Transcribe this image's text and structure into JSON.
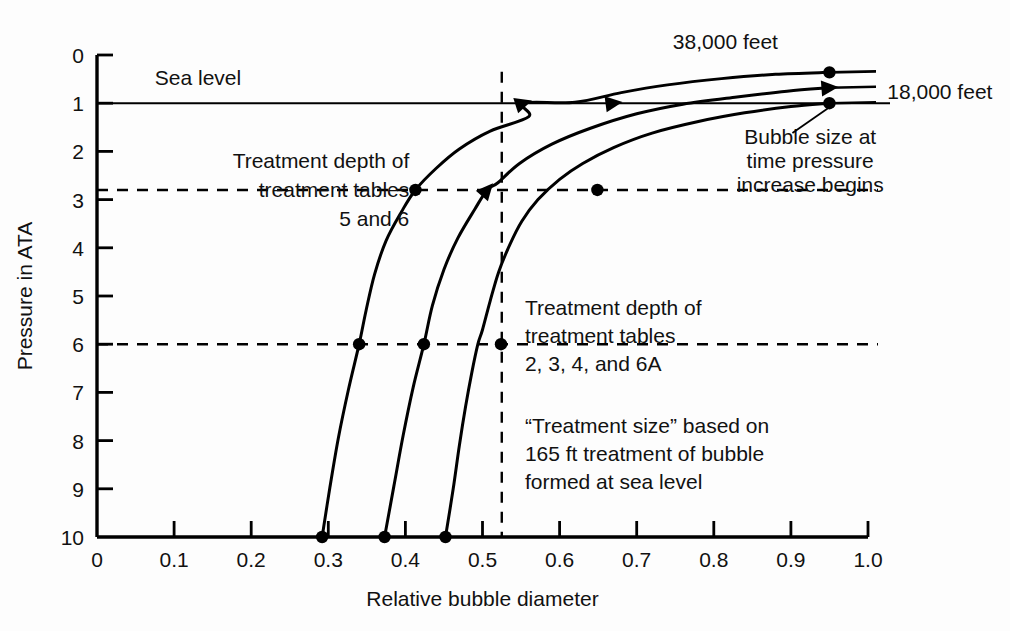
{
  "chart_data": {
    "type": "line",
    "title": "",
    "xlabel": "Relative bubble diameter",
    "ylabel": "Pressure in ATA",
    "xlim": [
      0,
      1.0
    ],
    "ylim": [
      0,
      10
    ],
    "y_axis_inverted": true,
    "grid": false,
    "legend_position": "none",
    "xticks": [
      "0",
      "0.1",
      "0.2",
      "0.3",
      "0.4",
      "0.5",
      "0.6",
      "0.7",
      "0.8",
      "0.9",
      "1.0"
    ],
    "xtick_values": [
      0,
      0.1,
      0.2,
      0.3,
      0.4,
      0.5,
      0.6,
      0.7,
      0.8,
      0.9,
      1.0
    ],
    "yticks": [
      "0",
      "1",
      "2",
      "3",
      "4",
      "5",
      "6",
      "7",
      "8",
      "9",
      "10"
    ],
    "ytick_values": [
      0,
      1,
      2,
      3,
      4,
      5,
      6,
      7,
      8,
      9,
      10
    ],
    "series": [
      {
        "name": "Bubble formed at sea level",
        "start_altitude_label": "sea level",
        "points": [
          {
            "x": 0.95,
            "y": 1.0
          },
          {
            "x": 0.9,
            "y": 1.07
          },
          {
            "x": 0.84,
            "y": 1.2
          },
          {
            "x": 0.78,
            "y": 1.38
          },
          {
            "x": 0.72,
            "y": 1.62
          },
          {
            "x": 0.67,
            "y": 1.92
          },
          {
            "x": 0.63,
            "y": 2.25
          },
          {
            "x": 0.6,
            "y": 2.58
          },
          {
            "x": 0.572,
            "y": 3.0
          },
          {
            "x": 0.551,
            "y": 3.45
          },
          {
            "x": 0.535,
            "y": 3.95
          },
          {
            "x": 0.521,
            "y": 4.5
          },
          {
            "x": 0.51,
            "y": 5.1
          },
          {
            "x": 0.5,
            "y": 5.7
          },
          {
            "x": 0.494,
            "y": 6.0
          },
          {
            "x": 0.486,
            "y": 6.6
          },
          {
            "x": 0.478,
            "y": 7.3
          },
          {
            "x": 0.47,
            "y": 8.1
          },
          {
            "x": 0.462,
            "y": 9.0
          },
          {
            "x": 0.452,
            "y": 10.0
          }
        ],
        "markers": [
          {
            "x": 0.95,
            "y": 1.0,
            "kind": "dot",
            "note": "Bubble size at time pressure increase begins"
          },
          {
            "x": 0.649,
            "y": 2.8,
            "kind": "dot",
            "note": "Treatment depth of treatment tables 5 and 6"
          },
          {
            "x": 0.524,
            "y": 6.0,
            "kind": "dot",
            "note": "Treatment depth of treatment tables 2, 3, 4, and 6A"
          },
          {
            "x": 0.452,
            "y": 10.0,
            "kind": "dot",
            "note": "bottom of curve"
          }
        ],
        "tail_line": {
          "from_x": 0.95,
          "to_x": 1.0,
          "y": 1.0
        }
      },
      {
        "name": "Bubble formed at 18,000 feet",
        "start_altitude_label": "18,000 feet",
        "points": [
          {
            "x": 0.95,
            "y": 0.68
          },
          {
            "x": 0.895,
            "y": 0.75
          },
          {
            "x": 0.83,
            "y": 0.87
          },
          {
            "x": 0.76,
            "y": 1.02
          },
          {
            "x": 0.7,
            "y": 1.22
          },
          {
            "x": 0.67,
            "y": 1.0
          },
          {
            "x": 0.64,
            "y": 1.52
          },
          {
            "x": 0.59,
            "y": 1.85
          },
          {
            "x": 0.548,
            "y": 2.25
          },
          {
            "x": 0.52,
            "y": 2.65
          },
          {
            "x": 0.506,
            "y": 2.8
          },
          {
            "x": 0.49,
            "y": 3.2
          },
          {
            "x": 0.468,
            "y": 3.8
          },
          {
            "x": 0.45,
            "y": 4.45
          },
          {
            "x": 0.435,
            "y": 5.2
          },
          {
            "x": 0.424,
            "y": 6.0
          },
          {
            "x": 0.41,
            "y": 6.9
          },
          {
            "x": 0.397,
            "y": 7.9
          },
          {
            "x": 0.385,
            "y": 8.95
          },
          {
            "x": 0.373,
            "y": 10.0
          }
        ],
        "markers": [
          {
            "x": 0.95,
            "y": 0.68,
            "kind": "arrow",
            "note": "curve tip with arrowhead"
          },
          {
            "x": 0.67,
            "y": 1.0,
            "kind": "arrow",
            "note": "crosses sea level line"
          },
          {
            "x": 0.506,
            "y": 2.8,
            "kind": "arrow",
            "note": "crosses 2.8 ATA treatment depth"
          },
          {
            "x": 0.424,
            "y": 6.0,
            "kind": "dot",
            "note": "crosses 6 ATA treatment depth"
          },
          {
            "x": 0.373,
            "y": 10.0,
            "kind": "dot",
            "note": "bottom of curve"
          }
        ],
        "tail_line": {
          "from_x": 0.95,
          "to_x": 1.0,
          "y": 0.68
        }
      },
      {
        "name": "Bubble formed at 38,000 feet",
        "start_altitude_label": "38,000 feet",
        "points": [
          {
            "x": 0.95,
            "y": 0.36
          },
          {
            "x": 0.88,
            "y": 0.4
          },
          {
            "x": 0.81,
            "y": 0.49
          },
          {
            "x": 0.74,
            "y": 0.62
          },
          {
            "x": 0.68,
            "y": 0.78
          },
          {
            "x": 0.62,
            "y": 0.98
          },
          {
            "x": 0.553,
            "y": 1.0
          },
          {
            "x": 0.56,
            "y": 1.28
          },
          {
            "x": 0.51,
            "y": 1.58
          },
          {
            "x": 0.47,
            "y": 1.95
          },
          {
            "x": 0.44,
            "y": 2.35
          },
          {
            "x": 0.413,
            "y": 2.8
          },
          {
            "x": 0.395,
            "y": 3.25
          },
          {
            "x": 0.375,
            "y": 3.85
          },
          {
            "x": 0.36,
            "y": 4.55
          },
          {
            "x": 0.349,
            "y": 5.3
          },
          {
            "x": 0.34,
            "y": 6.0
          },
          {
            "x": 0.326,
            "y": 6.95
          },
          {
            "x": 0.313,
            "y": 7.95
          },
          {
            "x": 0.302,
            "y": 8.98
          },
          {
            "x": 0.292,
            "y": 10.0
          }
        ],
        "markers": [
          {
            "x": 0.95,
            "y": 0.36,
            "kind": "dot",
            "note": "curve tip"
          },
          {
            "x": 0.553,
            "y": 1.0,
            "kind": "arrow",
            "note": "crosses sea level line"
          },
          {
            "x": 0.413,
            "y": 2.8,
            "kind": "dot",
            "note": "crosses 2.8 ATA treatment depth"
          },
          {
            "x": 0.34,
            "y": 6.0,
            "kind": "dot",
            "note": "crosses 6 ATA treatment depth"
          },
          {
            "x": 0.292,
            "y": 10.0,
            "kind": "dot",
            "note": "bottom of curve"
          }
        ],
        "tail_line": {
          "from_x": 0.95,
          "to_x": 1.0,
          "y": 0.36
        }
      }
    ],
    "reference_lines": [
      {
        "name": "sea-level-line",
        "orientation": "horizontal",
        "y": 1.0,
        "style": "solid",
        "label": "Sea level"
      },
      {
        "name": "treatment-depth-2-8-line",
        "orientation": "horizontal",
        "y": 2.8,
        "style": "dashed",
        "label": "Treatment depth of treatment tables 5 and 6"
      },
      {
        "name": "treatment-depth-6-line",
        "orientation": "horizontal",
        "y": 6.0,
        "style": "dashed",
        "label": "Treatment depth of treatment tables 2, 3, 4, and 6A"
      },
      {
        "name": "treatment-size-line",
        "orientation": "vertical",
        "x": 0.525,
        "style": "dashed",
        "label": "“Treatment size” based on 165 ft treatment of bubble formed at sea level"
      }
    ],
    "annotations": [
      {
        "id": "sea-level",
        "text": "Sea level",
        "x": 0.075,
        "y": 0.62,
        "align": "left"
      },
      {
        "id": "altitude-38000",
        "text": "38,000 feet",
        "x": 0.815,
        "y": -0.12,
        "align": "center"
      },
      {
        "id": "altitude-18000",
        "text": "18,000 feet",
        "x": 1.025,
        "y": 0.92,
        "align": "left"
      },
      {
        "id": "bubble-size-note-line1",
        "text": "Bubble size at",
        "x": 0.925,
        "y": 1.85,
        "align": "center"
      },
      {
        "id": "bubble-size-note-line2",
        "text": "time pressure",
        "x": 0.925,
        "y": 2.35,
        "align": "center"
      },
      {
        "id": "bubble-size-note-line3",
        "text": "increase begins",
        "x": 0.925,
        "y": 2.85,
        "align": "center"
      },
      {
        "id": "treatment-5-6-line1",
        "text": "Treatment depth of",
        "x": 0.405,
        "y": 2.35,
        "align": "right"
      },
      {
        "id": "treatment-5-6-line2",
        "text": "treatment tables",
        "x": 0.405,
        "y": 2.95,
        "align": "right"
      },
      {
        "id": "treatment-5-6-line3",
        "text": "5 and 6",
        "x": 0.405,
        "y": 3.55,
        "align": "right"
      },
      {
        "id": "treatment-2346a-line1",
        "text": "Treatment depth of",
        "x": 0.555,
        "y": 5.4,
        "align": "left"
      },
      {
        "id": "treatment-2346a-line2",
        "text": "treatment tables",
        "x": 0.555,
        "y": 5.98,
        "align": "left"
      },
      {
        "id": "treatment-2346a-line3",
        "text": "2, 3, 4, and 6A",
        "x": 0.555,
        "y": 6.56,
        "align": "left"
      },
      {
        "id": "treatment-size-line1",
        "text": "“Treatment size” based on",
        "x": 0.555,
        "y": 7.85,
        "align": "left"
      },
      {
        "id": "treatment-size-line2",
        "text": "165 ft treatment of bubble",
        "x": 0.555,
        "y": 8.43,
        "align": "left"
      },
      {
        "id": "treatment-size-line3",
        "text": "formed at sea level",
        "x": 0.555,
        "y": 9.01,
        "align": "left"
      }
    ],
    "colors": {
      "background": "#ffffff",
      "axis": "#000000",
      "curve": "#000000",
      "marker": "#000000",
      "reference": "#000000",
      "text": "#111111"
    }
  }
}
